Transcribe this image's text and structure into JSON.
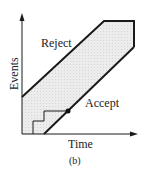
{
  "diagram": {
    "type": "sequential-test-plot",
    "y_axis_label": "Events",
    "x_axis_label": "Time",
    "region_labels": {
      "reject": "Reject",
      "accept": "Accept"
    },
    "caption": "(b)",
    "colors": {
      "line": "#1a1a1a",
      "fill": "#e8e8e8",
      "background": "#ffffff"
    }
  }
}
